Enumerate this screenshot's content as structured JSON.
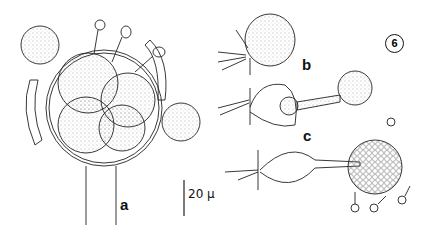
{
  "figure": {
    "number": "6",
    "panels": [
      {
        "id": "a",
        "label": "a"
      },
      {
        "id": "b",
        "label": "b"
      },
      {
        "id": "c",
        "label": "c"
      }
    ],
    "scale_bar": {
      "label": "20 µ",
      "value": 20,
      "unit": "µ"
    }
  }
}
